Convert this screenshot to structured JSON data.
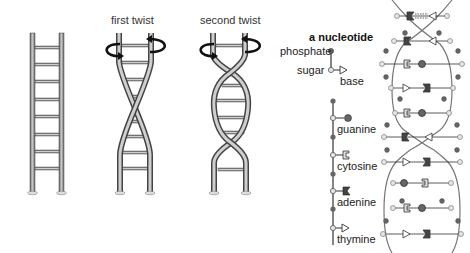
{
  "captions": {
    "first_twist": "first twist",
    "second_twist": "second twist"
  },
  "nucleotide_legend": {
    "title": "a nucleotide",
    "parts": {
      "phosphate": "phosphate",
      "sugar": "sugar",
      "base": "base"
    }
  },
  "bases": [
    {
      "name": "guanine",
      "symbol": "filled-circle"
    },
    {
      "name": "cytosine",
      "symbol": "open-bracket"
    },
    {
      "name": "adenine",
      "symbol": "filled-notch"
    },
    {
      "name": "thymine",
      "symbol": "open-triangle"
    }
  ],
  "colors": {
    "rail": "#8a8a8a",
    "rail_dark": "#555555",
    "phosphate": "#666666",
    "sugar": "#d8d8d8",
    "arrow": "#111111",
    "text": "#222222"
  }
}
